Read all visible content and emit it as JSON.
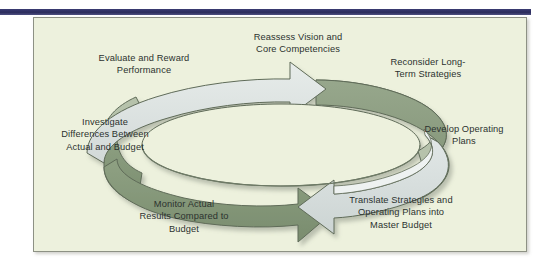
{
  "figure": {
    "type": "cycle-diagram",
    "background_color": "#edf1dd",
    "panel_border_color": "#8d9184",
    "rule_color": "#2b2c5c",
    "text_color": "#2c322f",
    "arrow_light_color": "#dee4e3",
    "arrow_dark_color": "#8fa183",
    "arrow_outline_color": "#5f6b58"
  },
  "steps": [
    {
      "id": "reassess",
      "label": "Reassess Vision and\nCore Competencies",
      "position": "top-center",
      "segment": "light-arrow-head"
    },
    {
      "id": "reconsider",
      "label": "Reconsider Long-\nTerm Strategies",
      "position": "top-right",
      "segment": "dark-band"
    },
    {
      "id": "develop",
      "label": "Develop Operating\nPlans",
      "position": "right",
      "segment": "dark-band"
    },
    {
      "id": "translate",
      "label": "Translate Strategies and\nOperating Plans into\nMaster Budget",
      "position": "bottom-right",
      "segment": "light-arrow"
    },
    {
      "id": "monitor",
      "label": "Monitor Actual\nResults Compared to\nBudget",
      "position": "bottom-center",
      "segment": "dark-arrow-head"
    },
    {
      "id": "investigate",
      "label": "Investigate\nDifferences Between\nActual and Budget",
      "position": "left",
      "segment": "dark-band"
    },
    {
      "id": "evaluate",
      "label": "Evaluate and Reward\nPerformance",
      "position": "top-left",
      "segment": "light-arrow"
    }
  ],
  "icons": {
    "arrow_clockwise_top": "arrow-right-icon",
    "arrow_counter_bottom": "arrow-left-icon"
  }
}
